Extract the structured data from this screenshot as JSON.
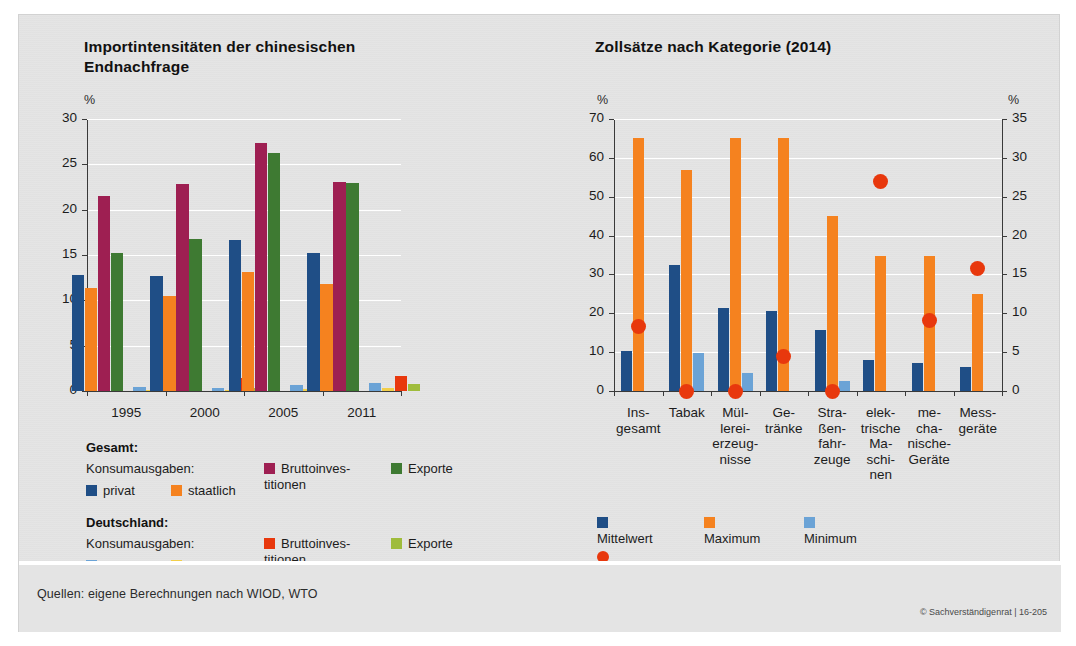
{
  "footer": {
    "source": "Quellen: eigene Berechnungen nach WIOD, WTO",
    "copyright": "© Sachverständigenrat | 16-205"
  },
  "chart_data": [
    {
      "type": "bar",
      "id": "import-intensities",
      "title": "Importintensitäten der chinesischen Endnachfrage",
      "unit_left": "%",
      "xlabel": "",
      "ylabel": "%",
      "ylim": [
        0,
        30
      ],
      "yticks": [
        0,
        5,
        10,
        15,
        20,
        25,
        30
      ],
      "grid": true,
      "legend_position": "below",
      "categories": [
        "1995",
        "2000",
        "2005",
        "2011"
      ],
      "series": [
        {
          "name": "Gesamt — Konsumausgaben: privat",
          "color": "#1f4e86",
          "values": [
            12.8,
            12.7,
            16.7,
            15.2
          ]
        },
        {
          "name": "Gesamt — Konsumausgaben: staatlich",
          "color": "#f5821f",
          "values": [
            11.4,
            10.5,
            13.1,
            11.8
          ]
        },
        {
          "name": "Gesamt — Bruttoinvestitionen",
          "color": "#9e1f52",
          "values": [
            21.5,
            22.8,
            27.4,
            23.0
          ]
        },
        {
          "name": "Gesamt — Exporte",
          "color": "#3e7a32",
          "values": [
            15.2,
            16.8,
            26.2,
            22.9
          ]
        },
        {
          "name": "Deutschland — Konsumausgaben: privat",
          "color": "#6ba3d6",
          "values": [
            0.4,
            0.35,
            0.7,
            0.9
          ]
        },
        {
          "name": "Deutschland — Konsumausgaben: staatlich",
          "color": "#f2cf4a",
          "values": [
            0.12,
            0.1,
            0.25,
            0.3
          ]
        },
        {
          "name": "Deutschland — Bruttoinvestitionen",
          "color": "#e8380d",
          "values": [
            1.7,
            1.4,
            2.1,
            1.7
          ]
        },
        {
          "name": "Deutschland — Exporte",
          "color": "#9fbc3c",
          "values": [
            0.4,
            0.35,
            0.75,
            0.75
          ]
        }
      ],
      "legend": {
        "group1_head": "Gesamt:",
        "group1_sub": "Konsumausgaben:",
        "group1_items": [
          {
            "label": "privat",
            "color": "#1f4e86"
          },
          {
            "label": "staatlich",
            "color": "#f5821f"
          },
          {
            "label": "Bruttoinves-\ntitionen",
            "color": "#9e1f52"
          },
          {
            "label": "Exporte",
            "color": "#3e7a32"
          }
        ],
        "group2_head": "Deutschland:",
        "group2_sub": "Konsumausgaben:",
        "group2_items": [
          {
            "label": "privat",
            "color": "#6ba3d6"
          },
          {
            "label": "staatlich",
            "color": "#f2cf4a"
          },
          {
            "label": "Bruttoinves-\ntitionen",
            "color": "#e8380d"
          },
          {
            "label": "Exporte",
            "color": "#9fbc3c"
          }
        ]
      }
    },
    {
      "type": "bar",
      "id": "tariff-rates",
      "title": "Zollsätze nach Kategorie (2014)",
      "unit_left": "%",
      "unit_right": "%",
      "xlabel": "",
      "ylabel": "%",
      "ylim": [
        0,
        70
      ],
      "yticks": [
        0,
        10,
        20,
        30,
        40,
        50,
        60,
        70
      ],
      "ylim_right": [
        0,
        35
      ],
      "yticks_right": [
        0,
        5,
        10,
        15,
        20,
        25,
        30,
        35
      ],
      "grid": true,
      "legend_position": "below",
      "categories": [
        "Ins-\ngesamt",
        "Tabak",
        "Mül-\nlerei-\nerzeug-\nnisse",
        "Ge-\ntränke",
        "Stra-\nßen-\nfahr-\nzeuge",
        "elek-\ntrische\nMa-\nschi-\nnen",
        "me-\ncha-\nnische-\nGeräte",
        "Mess-\ngeräte"
      ],
      "series": [
        {
          "name": "Mittelwert",
          "color": "#1f4e86",
          "axis": "left",
          "values": [
            10.3,
            32.4,
            21.3,
            20.7,
            15.7,
            8.0,
            7.3,
            6.1
          ]
        },
        {
          "name": "Maximum",
          "color": "#f5821f",
          "axis": "left",
          "values": [
            65.0,
            57.0,
            65.0,
            65.0,
            45.0,
            34.7,
            34.7,
            25.0
          ]
        },
        {
          "name": "Minimum",
          "color": "#6ba3d6",
          "axis": "left",
          "values": [
            0.0,
            9.9,
            4.6,
            0.0,
            2.6,
            0.0,
            0.0,
            0.0
          ]
        },
        {
          "name": "zollfreier Anteil (rechte Skala)",
          "color": "#e8380d",
          "axis": "right",
          "type": "scatter",
          "values": [
            8.3,
            0.0,
            0.0,
            4.5,
            0.0,
            27.0,
            9.1,
            15.7
          ]
        }
      ],
      "legend": {
        "items": [
          {
            "label": "Mittelwert",
            "color": "#1f4e86",
            "shape": "square"
          },
          {
            "label": "Maximum",
            "color": "#f5821f",
            "shape": "square"
          },
          {
            "label": "Minimum",
            "color": "#6ba3d6",
            "shape": "square"
          },
          {
            "label": "zollfreier Anteil (rechte Skala)",
            "color": "#e8380d",
            "shape": "circle"
          }
        ]
      }
    }
  ]
}
